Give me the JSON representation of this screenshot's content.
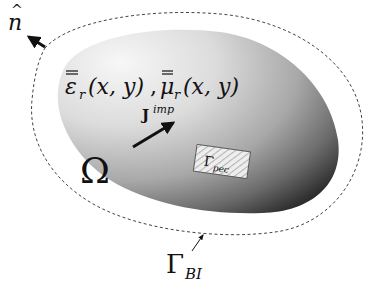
{
  "figure": {
    "domain_label": {
      "symbol": "Ω"
    },
    "normal_label": {
      "symbol": "n",
      "accent": "^"
    },
    "material_label": {
      "eps": "ε",
      "mu": "μ",
      "subscript": "r",
      "args": "(x, y)",
      "separator": ","
    },
    "source_label": {
      "base": "J",
      "superscript": "imp"
    },
    "pec_label": {
      "base": "Γ",
      "subscript": "pec"
    },
    "boundary_label": {
      "base": "Γ",
      "subscript": "BI"
    },
    "colors": {
      "blob_light": "#f4f4f4",
      "blob_mid": "#bdbdbd",
      "blob_dark": "#3a3a3a",
      "dash_line": "#444444",
      "arrow": "#111111",
      "pec_fill": "#e8e8e8",
      "pec_hatch": "#bbbbbb"
    }
  }
}
